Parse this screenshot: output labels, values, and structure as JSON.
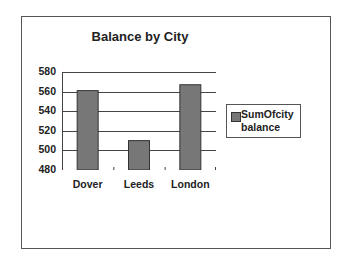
{
  "chart_data": {
    "type": "bar",
    "title": "Balance by City",
    "categories": [
      "Dover",
      "Leeds",
      "London"
    ],
    "series": [
      {
        "name": "SumOfcity balance",
        "values": [
          561,
          510,
          567
        ]
      }
    ],
    "xlabel": "",
    "ylabel": "",
    "ylim": [
      480,
      580
    ],
    "yticks": [
      480,
      500,
      520,
      540,
      560,
      580
    ],
    "grid": true,
    "legend_position": "right",
    "bar_color": "#777777"
  },
  "legend": {
    "line1": "SumOfcity",
    "line2": "balance"
  },
  "title": "Balance by City"
}
